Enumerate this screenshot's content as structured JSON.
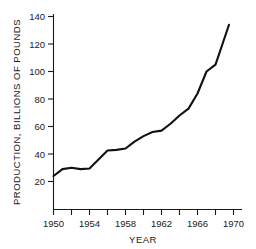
{
  "chart_data": {
    "type": "line",
    "title": "",
    "xlabel": "YEAR",
    "ylabel": "PRODUCTION, BILLIONS OF POUNDS",
    "xlim": [
      1949,
      1971
    ],
    "ylim": [
      0,
      145
    ],
    "grid": false,
    "legend": "none",
    "line_color": "#111111",
    "axis_color": "#1a1a1a",
    "background": "#ffffff",
    "x_major_ticks": [
      1950,
      1954,
      1958,
      1962,
      1966,
      1970
    ],
    "x_major_tick_labels": [
      "1950",
      "1954",
      "1958",
      "1962",
      "1966",
      "1970"
    ],
    "x_minor_ticks": [
      1952,
      1956,
      1960,
      1964,
      1968
    ],
    "y_major_ticks": [
      20,
      40,
      60,
      80,
      100,
      120,
      140
    ],
    "y_major_tick_labels": [
      "20",
      "40",
      "60",
      "80",
      "100",
      "120",
      "140"
    ],
    "x": [
      1950,
      1951,
      1952,
      1953,
      1954,
      1955,
      1956,
      1957,
      1958,
      1959,
      1960,
      1961,
      1962,
      1963,
      1964,
      1965,
      1966,
      1967,
      1968,
      1969.5
    ],
    "values": [
      24,
      29,
      30,
      29,
      29.5,
      36,
      42.5,
      43,
      44,
      49,
      53,
      56,
      57,
      62,
      68,
      73,
      84,
      100,
      105,
      134
    ],
    "series": [
      {
        "name": "Production",
        "values": [
          24,
          29,
          30,
          29,
          29.5,
          36,
          42.5,
          43,
          44,
          49,
          53,
          56,
          57,
          62,
          68,
          73,
          84,
          100,
          105,
          134
        ]
      }
    ]
  },
  "axis": {
    "y_title": "PRODUCTION, BILLIONS OF POUNDS",
    "x_title": "YEAR"
  },
  "ticks": {
    "y": [
      "140",
      "120",
      "100",
      "80",
      "60",
      "40",
      "20"
    ],
    "x": [
      "1950",
      "1954",
      "1958",
      "1962",
      "1966",
      "1970"
    ]
  }
}
